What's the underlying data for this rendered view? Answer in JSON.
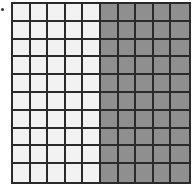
{
  "diagram": {
    "type": "hundred-grid",
    "rows": 10,
    "columns": 10,
    "shaded_columns": [
      6,
      7,
      8,
      9,
      10
    ],
    "shaded_count": 50,
    "total_cells": 100,
    "colors": {
      "unshaded": "#f2f2f2",
      "shaded": "#8f8f8f",
      "lines": "#2a2a2a"
    }
  }
}
